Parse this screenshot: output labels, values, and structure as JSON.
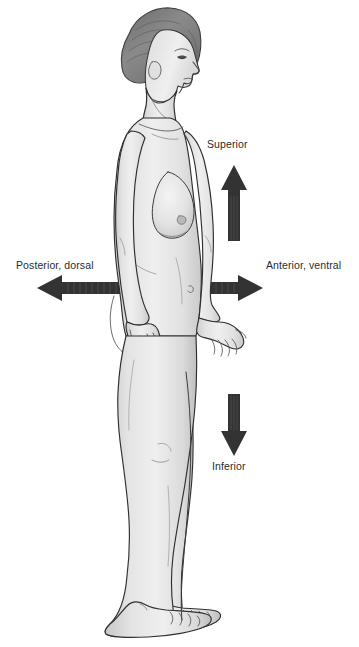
{
  "diagram": {
    "type": "anatomical-directional-terms",
    "background_color": "#ffffff",
    "arrow_color": "#333333",
    "text_color": "#2b2b2b",
    "body_fill_color": "#e8e8e8",
    "hair_color": "#858585",
    "outline_color": "#2f2f2f"
  },
  "labels": {
    "superior": "Superior",
    "inferior": "Inferior",
    "posterior": "Posterior, dorsal",
    "anterior": "Anterior, ventral"
  },
  "arrows": {
    "up": {
      "direction": "up",
      "x": 234,
      "y_top": 165,
      "y_bottom": 241
    },
    "down": {
      "direction": "down",
      "x": 234,
      "y_top": 394,
      "y_bottom": 456
    },
    "left": {
      "direction": "left",
      "y": 288,
      "x_left": 37,
      "x_right": 121
    },
    "right": {
      "direction": "right",
      "y": 288,
      "x_left": 204,
      "x_right": 263
    }
  }
}
